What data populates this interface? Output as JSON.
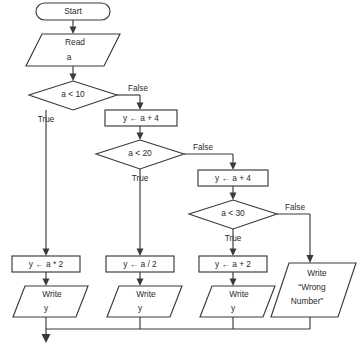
{
  "diagram": {
    "type": "flowchart",
    "colors": {
      "background": "#ffffff",
      "stroke": "#3a3a3a",
      "fill": "#ffffff",
      "text": "#2b2b2b"
    },
    "nodes": {
      "start": {
        "label": "Start",
        "shape": "terminator"
      },
      "read_a": {
        "line1": "Read",
        "line2": "a",
        "shape": "parallelogram"
      },
      "cond_a_lt_10": {
        "label": "a < 10",
        "shape": "diamond"
      },
      "assign_y_a_plus_4_first": {
        "label": "y ← a + 4",
        "shape": "rectangle"
      },
      "cond_a_lt_20": {
        "label": "a < 20",
        "shape": "diamond"
      },
      "assign_y_a_plus_4_second": {
        "label": "y ← a + 4",
        "shape": "rectangle"
      },
      "cond_a_lt_30": {
        "label": "a < 30",
        "shape": "diamond"
      },
      "assign_y_a_times_2": {
        "label": "y ← a * 2",
        "shape": "rectangle"
      },
      "assign_y_a_div_2": {
        "label": "y ← a / 2",
        "shape": "rectangle"
      },
      "assign_y_a_plus_2": {
        "label": "y ← a + 2",
        "shape": "rectangle"
      },
      "write_y_1": {
        "line1": "Write",
        "line2": "y",
        "shape": "parallelogram"
      },
      "write_y_2": {
        "line1": "Write",
        "line2": "y",
        "shape": "parallelogram"
      },
      "write_y_3": {
        "line1": "Write",
        "line2": "y",
        "shape": "parallelogram"
      },
      "write_wrong_number": {
        "line1": "Write",
        "line2": "“Wrong",
        "line3": "Number”",
        "shape": "parallelogram"
      }
    },
    "edge_labels": {
      "true_a10": "True",
      "false_a10": "False",
      "true_a20": "True",
      "false_a20": "False",
      "true_a30": "True",
      "false_a30": "False"
    }
  }
}
